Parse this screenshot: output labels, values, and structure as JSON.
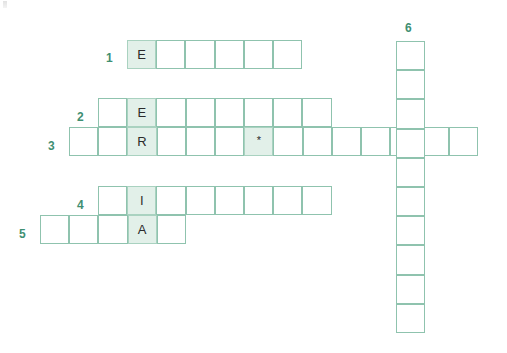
{
  "puzzle": {
    "type": "crossword",
    "vertical_word": "ENERGIA",
    "cell_size": 29.2,
    "colors": {
      "grid_line": "#8fc3ae",
      "shaded_fill": "#e2f0e9",
      "shaded_line": "#a9d2c0",
      "clue_number": "#3f8f72",
      "letter": "#2b2b2b",
      "background": "#ffffff"
    },
    "clue_numbers": [
      {
        "label": "1",
        "x": 106,
        "y": 52
      },
      {
        "label": "2",
        "x": 77,
        "y": 111
      },
      {
        "label": "3",
        "x": 48,
        "y": 140
      },
      {
        "label": "4",
        "x": 77,
        "y": 199
      },
      {
        "label": "5",
        "x": 19,
        "y": 228
      },
      {
        "label": "6",
        "x": 405,
        "y": 22
      }
    ],
    "rows": [
      {
        "number": "1",
        "x": 127,
        "y": 40,
        "length": 6,
        "cells": [
          {
            "letter": "E",
            "shaded": true
          },
          {
            "letter": "",
            "shaded": false
          },
          {
            "letter": "",
            "shaded": false
          },
          {
            "letter": "",
            "shaded": false
          },
          {
            "letter": "",
            "shaded": false
          },
          {
            "letter": "",
            "shaded": false
          }
        ]
      },
      {
        "number": "2",
        "x": 98,
        "y": 98,
        "length": 8,
        "cells": [
          {
            "letter": "",
            "shaded": false
          },
          {
            "letter": "E",
            "shaded": true
          },
          {
            "letter": "",
            "shaded": false
          },
          {
            "letter": "",
            "shaded": false
          },
          {
            "letter": "",
            "shaded": false
          },
          {
            "letter": "",
            "shaded": false
          },
          {
            "letter": "",
            "shaded": false
          },
          {
            "letter": "",
            "shaded": false
          }
        ]
      },
      {
        "number": "3",
        "x": 69,
        "y": 127,
        "length": 14,
        "cells": [
          {
            "letter": "",
            "shaded": false
          },
          {
            "letter": "",
            "shaded": false
          },
          {
            "letter": "R",
            "shaded": true
          },
          {
            "letter": "",
            "shaded": false
          },
          {
            "letter": "",
            "shaded": false
          },
          {
            "letter": "",
            "shaded": false
          },
          {
            "letter": "*",
            "shaded": false,
            "star": true
          },
          {
            "letter": "",
            "shaded": false
          },
          {
            "letter": "",
            "shaded": false
          },
          {
            "letter": "",
            "shaded": false
          },
          {
            "letter": "",
            "shaded": false
          },
          {
            "letter": "",
            "shaded": false
          },
          {
            "letter": "",
            "shaded": false
          },
          {
            "letter": "",
            "shaded": false
          }
        ]
      },
      {
        "number": "4",
        "x": 98,
        "y": 186,
        "length": 8,
        "cells": [
          {
            "letter": "",
            "shaded": false
          },
          {
            "letter": "I",
            "shaded": true
          },
          {
            "letter": "",
            "shaded": false
          },
          {
            "letter": "",
            "shaded": false
          },
          {
            "letter": "",
            "shaded": false
          },
          {
            "letter": "",
            "shaded": false
          },
          {
            "letter": "",
            "shaded": false
          },
          {
            "letter": "",
            "shaded": false
          }
        ]
      },
      {
        "number": "5",
        "x": 40,
        "y": 215,
        "length": 5,
        "cells": [
          {
            "letter": "",
            "shaded": false
          },
          {
            "letter": "",
            "shaded": false
          },
          {
            "letter": "",
            "shaded": false
          },
          {
            "letter": "A",
            "shaded": true
          },
          {
            "letter": "",
            "shaded": false
          }
        ]
      }
    ],
    "columns": [
      {
        "number": "6",
        "x": 396,
        "y": 41,
        "length": 10,
        "cells": [
          {
            "letter": ""
          },
          {
            "letter": ""
          },
          {
            "letter": ""
          },
          {
            "letter": ""
          },
          {
            "letter": ""
          },
          {
            "letter": ""
          },
          {
            "letter": ""
          },
          {
            "letter": ""
          },
          {
            "letter": ""
          },
          {
            "letter": ""
          }
        ]
      }
    ],
    "hidden_column": {
      "name": "energia-column",
      "x": 127,
      "y": 40,
      "letters": [
        "E",
        "N",
        "E",
        "R",
        "G",
        "I",
        "A"
      ]
    }
  }
}
